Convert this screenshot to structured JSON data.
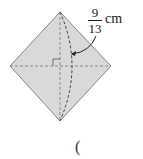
{
  "figure": {
    "label": {
      "numerator": "9",
      "denominator": "13",
      "unit": "cm"
    },
    "answer_paren_open": "("
  },
  "colors": {
    "fill": "#d9d9d9",
    "stroke": "#888888",
    "dashed": "#555555"
  }
}
